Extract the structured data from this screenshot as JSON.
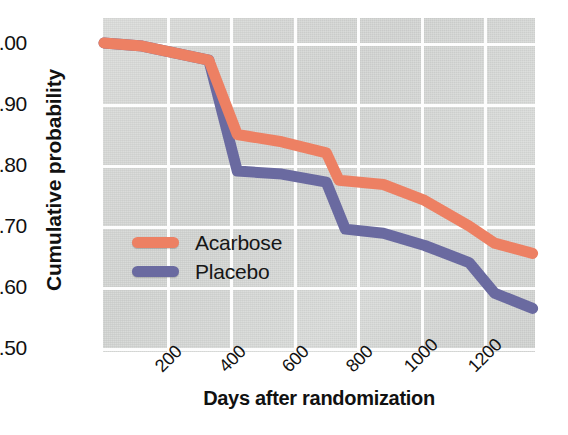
{
  "chart_data": {
    "type": "line",
    "title": "",
    "xlabel": "Days after randomization",
    "ylabel": "Cumulative probability",
    "xlim": [
      0,
      1380
    ],
    "ylim": [
      0.5,
      1.0
    ],
    "xticks": [
      200,
      400,
      600,
      800,
      1000,
      1200
    ],
    "yticks": [
      "0.50",
      "0.60",
      "0.70",
      "0.80",
      "0.90",
      "1.00"
    ],
    "grid": true,
    "legend_position": "center-left",
    "series": [
      {
        "name": "Acarbose",
        "color": "#ED8063",
        "x": [
          0,
          120,
          330,
          420,
          560,
          700,
          740,
          880,
          1010,
          1150,
          1230,
          1350
        ],
        "y": [
          1.0,
          0.995,
          0.972,
          0.85,
          0.838,
          0.82,
          0.775,
          0.768,
          0.742,
          0.7,
          0.672,
          0.655
        ]
      },
      {
        "name": "Placebo",
        "color": "#6A6AA0",
        "x": [
          0,
          120,
          330,
          420,
          560,
          700,
          760,
          880,
          1010,
          1150,
          1230,
          1350
        ],
        "y": [
          1.0,
          0.995,
          0.972,
          0.79,
          0.785,
          0.772,
          0.695,
          0.688,
          0.668,
          0.64,
          0.59,
          0.565
        ]
      }
    ],
    "colors": {
      "acarbose": "#ED8063",
      "placebo": "#6A6AA0",
      "panel_background": "#d9dbd9",
      "gridline": "#fdfdfd",
      "text": "#111111"
    }
  },
  "legend": {
    "items": [
      {
        "label": "Acarbose",
        "color": "#ED8063"
      },
      {
        "label": "Placebo",
        "color": "#6A6AA0"
      }
    ]
  },
  "axes": {
    "y_tick_labels": [
      "1.00",
      "0.90",
      "0.80",
      "0.70",
      "0.60",
      "0.50"
    ],
    "x_tick_labels": [
      "200",
      "400",
      "600",
      "800",
      "1000",
      "1200"
    ],
    "y_title": "Cumulative probability",
    "x_title": "Days after randomization"
  }
}
